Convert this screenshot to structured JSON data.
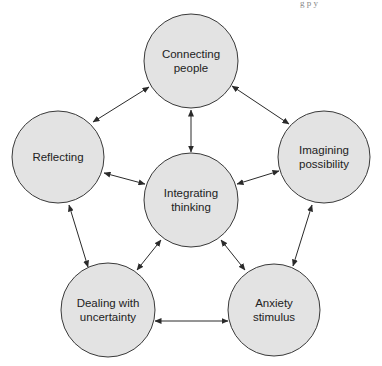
{
  "header": {
    "running_head_fragment": "g p       y"
  },
  "diagram": {
    "type": "network",
    "colors": {
      "node_fill": "#e3e3e3",
      "node_stroke": "#3a3a3a",
      "edge": "#2a2a2a",
      "text": "#222222"
    },
    "nodes": [
      {
        "id": "connecting",
        "lines": [
          "Connecting",
          "people"
        ],
        "cx": 191,
        "cy": 61,
        "r": 47
      },
      {
        "id": "reflecting",
        "lines": [
          "Reflecting"
        ],
        "cx": 58,
        "cy": 157,
        "r": 46
      },
      {
        "id": "imagining",
        "lines": [
          "Imagining",
          "possibility"
        ],
        "cx": 324,
        "cy": 157,
        "r": 46
      },
      {
        "id": "integrating",
        "lines": [
          "Integrating",
          "thinking"
        ],
        "cx": 191,
        "cy": 200,
        "r": 47
      },
      {
        "id": "dealing",
        "lines": [
          "Dealing with",
          "uncertainty"
        ],
        "cx": 108,
        "cy": 310,
        "r": 47
      },
      {
        "id": "anxiety",
        "lines": [
          "Anxiety",
          "stimulus"
        ],
        "cx": 274,
        "cy": 310,
        "r": 46
      }
    ],
    "edges": [
      {
        "from": "reflecting",
        "to": "connecting",
        "x1": 93,
        "y1": 122,
        "x2": 149,
        "y2": 87,
        "direction": "both"
      },
      {
        "from": "connecting",
        "to": "imagining",
        "x1": 232,
        "y1": 86,
        "x2": 289,
        "y2": 124,
        "direction": "both"
      },
      {
        "from": "connecting",
        "to": "integrating",
        "x1": 191,
        "y1": 110,
        "x2": 191,
        "y2": 152,
        "direction": "both"
      },
      {
        "from": "reflecting",
        "to": "integrating",
        "x1": 104,
        "y1": 173,
        "x2": 145,
        "y2": 184,
        "direction": "both"
      },
      {
        "from": "integrating",
        "to": "imagining",
        "x1": 237,
        "y1": 184,
        "x2": 279,
        "y2": 171,
        "direction": "both"
      },
      {
        "from": "reflecting",
        "to": "dealing",
        "x1": 69,
        "y1": 205,
        "x2": 88,
        "y2": 267,
        "direction": "both"
      },
      {
        "from": "imagining",
        "to": "anxiety",
        "x1": 312,
        "y1": 205,
        "x2": 293,
        "y2": 266,
        "direction": "both"
      },
      {
        "from": "integrating",
        "to": "dealing",
        "x1": 161,
        "y1": 240,
        "x2": 137,
        "y2": 270,
        "direction": "both"
      },
      {
        "from": "integrating",
        "to": "anxiety",
        "x1": 221,
        "y1": 240,
        "x2": 245,
        "y2": 270,
        "direction": "both"
      },
      {
        "from": "dealing",
        "to": "anxiety",
        "x1": 155,
        "y1": 321,
        "x2": 228,
        "y2": 321,
        "direction": "both"
      }
    ]
  }
}
